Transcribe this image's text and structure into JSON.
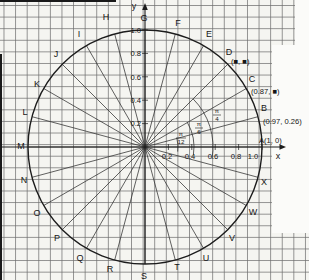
{
  "figure": {
    "type": "unit-circle-diagram",
    "axis": {
      "x_label": "x",
      "y_label": "y"
    },
    "x_tick_labels": [
      "0.2",
      "0.4",
      "0.6",
      "0.8",
      "1.0"
    ],
    "y_tick_labels": [
      "1.0",
      "0.8",
      "0.6",
      "0.4",
      "0.2"
    ],
    "angle_labels": [
      {
        "num": "π",
        "den": "12",
        "angle_deg": 15
      },
      {
        "num": "π",
        "den": "6",
        "angle_deg": 30
      },
      {
        "num": "π",
        "den": "4",
        "angle_deg": 45
      }
    ],
    "points": [
      {
        "letter": "A",
        "angle_deg": 0,
        "label": "A(1, 0)"
      },
      {
        "letter": "B",
        "angle_deg": 15,
        "coords": "(0.97, 0.26)"
      },
      {
        "letter": "C",
        "angle_deg": 30,
        "coords": "(0.87, ■)"
      },
      {
        "letter": "D",
        "angle_deg": 45,
        "coords": "(■, ■)"
      },
      {
        "letter": "E",
        "angle_deg": 60
      },
      {
        "letter": "F",
        "angle_deg": 75
      },
      {
        "letter": "G",
        "angle_deg": 90
      },
      {
        "letter": "H",
        "angle_deg": 105
      },
      {
        "letter": "I",
        "angle_deg": 120
      },
      {
        "letter": "J",
        "angle_deg": 135
      },
      {
        "letter": "K",
        "angle_deg": 150
      },
      {
        "letter": "L",
        "angle_deg": 165
      },
      {
        "letter": "M",
        "angle_deg": 180
      },
      {
        "letter": "N",
        "angle_deg": 195
      },
      {
        "letter": "O",
        "angle_deg": 210
      },
      {
        "letter": "P",
        "angle_deg": 225
      },
      {
        "letter": "Q",
        "angle_deg": 240
      },
      {
        "letter": "R",
        "angle_deg": 255
      },
      {
        "letter": "S",
        "angle_deg": 270
      },
      {
        "letter": "T",
        "angle_deg": 285
      },
      {
        "letter": "U",
        "angle_deg": 300
      },
      {
        "letter": "V",
        "angle_deg": 315
      },
      {
        "letter": "W",
        "angle_deg": 330
      },
      {
        "letter": "X",
        "angle_deg": 345
      }
    ],
    "colors": {
      "paper": "#f5f5f1",
      "grid": "#9a9a9a",
      "ink": "#1c1c1c"
    }
  }
}
